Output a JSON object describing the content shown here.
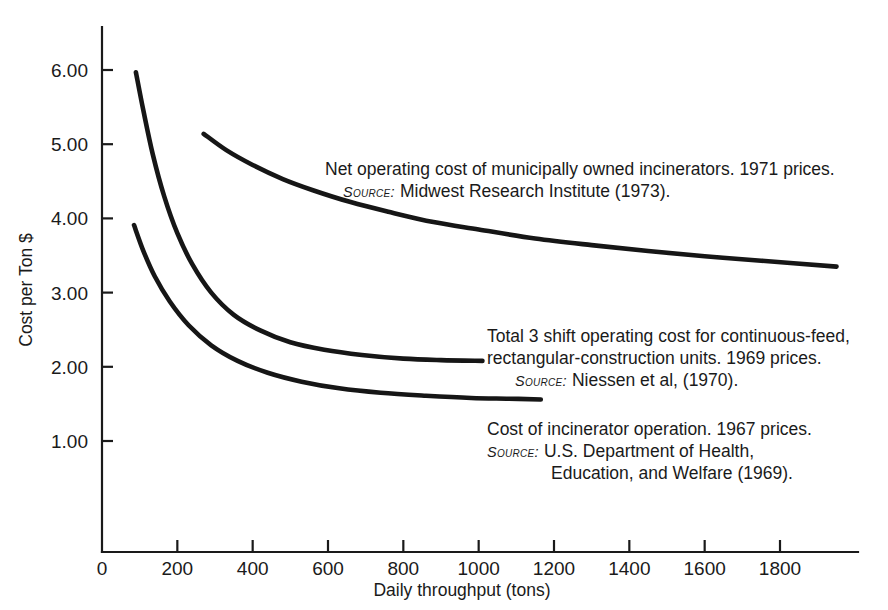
{
  "chart_data": {
    "type": "line",
    "title": "",
    "xlabel": "Daily throughput (tons)",
    "ylabel": "Cost per Ton $",
    "xlim": [
      0,
      1950
    ],
    "ylim": [
      0,
      6.6
    ],
    "grid": false,
    "legend_position": "inline-annotations",
    "xticks": [
      0,
      200,
      400,
      600,
      800,
      1000,
      1200,
      1400,
      1600,
      1800
    ],
    "xticklabels": [
      "0",
      "200",
      "400",
      "600",
      "800",
      "1000",
      "1200",
      "1400",
      "1600",
      "1800"
    ],
    "yticks": [
      1.0,
      2.0,
      3.0,
      4.0,
      5.0,
      6.0
    ],
    "yticklabels": [
      "1.00",
      "2.00",
      "3.00",
      "4.00",
      "5.00",
      "6.00"
    ],
    "series": [
      {
        "name": "Net operating cost of municipally owned incinerators (1971 prices)",
        "x": [
          270,
          330,
          400,
          480,
          560,
          660,
          760,
          880,
          1000,
          1150,
          1300,
          1450,
          1600,
          1750,
          1950
        ],
        "y": [
          5.14,
          4.92,
          4.72,
          4.53,
          4.38,
          4.22,
          4.09,
          3.95,
          3.85,
          3.73,
          3.64,
          3.56,
          3.49,
          3.43,
          3.35
        ]
      },
      {
        "name": "Total 3 shift operating cost for continuous-feed, rectangular-construction units (1969 prices)",
        "x": [
          90,
          110,
          135,
          165,
          200,
          240,
          290,
          350,
          420,
          500,
          590,
          690,
          800,
          900,
          1010
        ],
        "y": [
          5.97,
          5.45,
          4.86,
          4.3,
          3.8,
          3.38,
          3.0,
          2.7,
          2.49,
          2.33,
          2.23,
          2.16,
          2.11,
          2.09,
          2.08
        ]
      },
      {
        "name": "Cost of incinerator operation (1967 prices)",
        "x": [
          85,
          110,
          140,
          180,
          230,
          290,
          360,
          440,
          530,
          630,
          740,
          860,
          980,
          1080,
          1165
        ],
        "y": [
          3.91,
          3.56,
          3.22,
          2.88,
          2.56,
          2.29,
          2.08,
          1.92,
          1.8,
          1.71,
          1.65,
          1.61,
          1.58,
          1.57,
          1.56
        ]
      }
    ],
    "annotations": [
      {
        "id": "annotation-incinerators-1971",
        "lines": [
          {
            "kind": "text",
            "value": "Net operating cost of municipally owned incinerators. 1971 prices."
          },
          {
            "kind": "source",
            "label": "Source:",
            "value": "Midwest Research Institute (1973)."
          }
        ]
      },
      {
        "id": "annotation-continuous-feed-1969",
        "lines": [
          {
            "kind": "text",
            "value": "Total 3 shift operating cost for continuous-feed,"
          },
          {
            "kind": "text",
            "value": "rectangular-construction units. 1969 prices."
          },
          {
            "kind": "source",
            "label": "Source:",
            "value": "Niessen et al, (1970)."
          }
        ]
      },
      {
        "id": "annotation-incinerator-operation-1967",
        "lines": [
          {
            "kind": "text",
            "value": "Cost of incinerator operation. 1967 prices."
          },
          {
            "kind": "source",
            "label": "Source:",
            "value": "U.S. Department of Health,"
          },
          {
            "kind": "text",
            "value": "Education, and Welfare (1969)."
          }
        ]
      }
    ],
    "colors": {
      "curve": "#161616",
      "axis": "#1a1a1a",
      "text": "#1a1a1a",
      "background": "#ffffff"
    }
  },
  "layout": {
    "plot": {
      "x0": 102,
      "y0": 552,
      "x1": 858,
      "yTop": 27
    },
    "annotation_positions": [
      {
        "x": 325,
        "y": 175,
        "line_height": 22
      },
      {
        "x": 487,
        "y": 342,
        "line_height": 22
      },
      {
        "x": 487,
        "y": 435,
        "line_height": 22
      },
      {
        "x": 551,
        "y": 479,
        "line_height": 22
      }
    ]
  }
}
